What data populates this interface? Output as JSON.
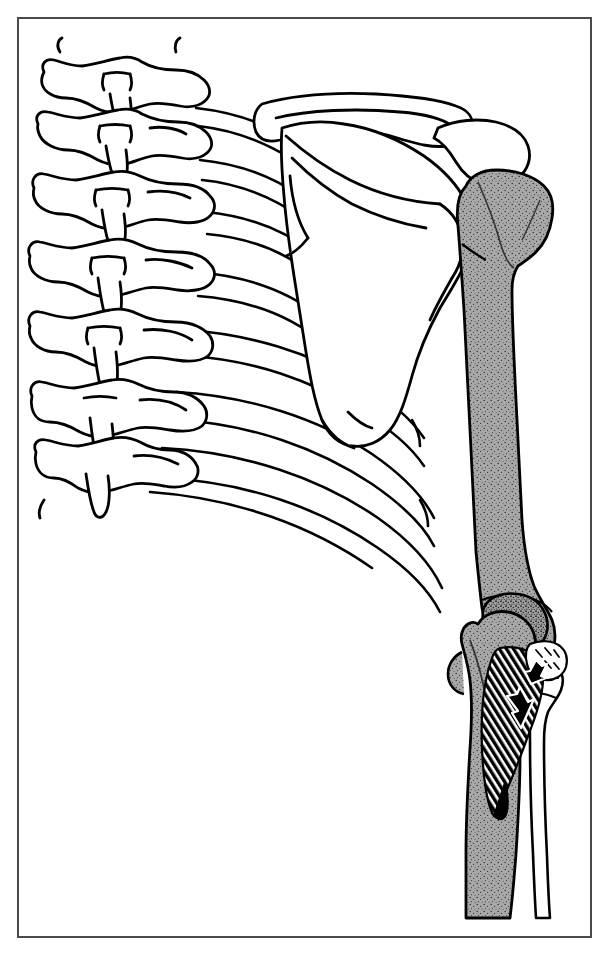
{
  "figure": {
    "domain": "anatomical-line-illustration",
    "title": "Posterior view of shoulder girdle, humerus and elbow",
    "view": "posterior",
    "laterality": "right",
    "style": "black ink line drawing with stippled gray fill",
    "background_color": "#ffffff",
    "frame": {
      "present": true,
      "color": "#4a4a4a",
      "stroke_width": 2,
      "x": 17,
      "y": 17,
      "width": 575,
      "height": 921
    },
    "palette": {
      "ink": "#000000",
      "frame": "#4a4a4a",
      "bone_outline_fill": "#ffffff",
      "shaded_bone_fill": "#a8a8a8",
      "shaded_bone_stipple": "#3a3a3a",
      "hatch_fill": "#000000",
      "arrow_fill": "#000000",
      "ligament_white": "#ffffff"
    },
    "labels": [],
    "annotations": [
      {
        "name": "arrow-upper",
        "kind": "solid-black-arrow",
        "points": "up-left",
        "tip_x": 530,
        "tip_y": 690,
        "tail_x": 543,
        "tail_y": 712,
        "meaning": "direction of muscle pull / avulsion"
      },
      {
        "name": "arrow-lower",
        "kind": "solid-black-arrow",
        "points": "up-left",
        "tip_x": 510,
        "tip_y": 700,
        "tail_x": 525,
        "tail_y": 726,
        "meaning": "direction of muscle pull / avulsion"
      }
    ],
    "structures": [
      {
        "name": "thoracic-vertebrae",
        "count": 7,
        "region": "left",
        "fill": "white",
        "description": "stacked posterior vertebrae with spinous and transverse processes"
      },
      {
        "name": "ribs",
        "count": 8,
        "region": "left-center",
        "fill": "white",
        "description": "posterior ribs radiating laterally from vertebral bodies"
      },
      {
        "name": "scapula",
        "region": "center",
        "fill": "white",
        "description": "scapular body with spine, acromion, coracoid and inferior angle"
      },
      {
        "name": "clavicle",
        "region": "upper-center",
        "fill": "white",
        "description": "clavicle arcing laterally to the acromioclavicular joint"
      },
      {
        "name": "acromion",
        "region": "upper-right",
        "fill": "white"
      },
      {
        "name": "humerus",
        "region": "right",
        "fill": "shaded-gray",
        "description": "humeral head, surgical neck, shaft and distal condyles, stippled gray"
      },
      {
        "name": "ulna",
        "region": "lower-right",
        "fill": "shaded-gray",
        "description": "olecranon, trochlear notch and ulnar shaft, stippled gray"
      },
      {
        "name": "radius",
        "region": "lower-right",
        "fill": "white",
        "description": "radial head, neck and shaft, unshaded outline"
      },
      {
        "name": "muscle-hatching",
        "region": "lower-right",
        "fill": "black-line-hatch",
        "description": "dense parallel hatching over the proximal ulna representing muscle/tendon"
      },
      {
        "name": "ligament-avulsion",
        "region": "lower-right",
        "fill": "white",
        "description": "white wedge with short marks indicating a torn or detached ligament"
      }
    ]
  }
}
